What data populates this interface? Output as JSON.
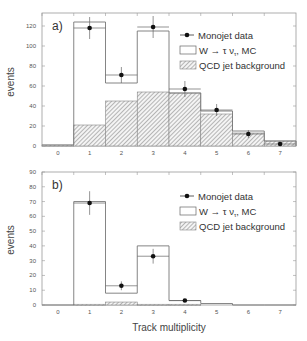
{
  "chart_data": [
    {
      "type": "bar",
      "panel_label": "a)",
      "title": "",
      "xlabel": "",
      "ylabel": "events",
      "categories": [
        "0",
        "1",
        "2",
        "3",
        "4",
        "5",
        "6",
        "7"
      ],
      "xlim": [
        -0.5,
        7.5
      ],
      "ylim": [
        0,
        130
      ],
      "yticks": [
        0,
        20,
        40,
        60,
        80,
        100,
        120
      ],
      "series": [
        {
          "name": "Monojet data",
          "kind": "points",
          "values": [
            null,
            118,
            71,
            119,
            57,
            36,
            12,
            2
          ],
          "errors": [
            null,
            11,
            8,
            11,
            8,
            6,
            4,
            2
          ]
        },
        {
          "name": "W → τ ν_τ MC",
          "kind": "histogram",
          "values": [
            1,
            124,
            63,
            115,
            53,
            35,
            15,
            5
          ]
        },
        {
          "name": "QCD jet background",
          "kind": "hatched-histogram",
          "values": [
            1,
            21,
            45,
            54,
            53,
            32,
            13,
            5
          ]
        }
      ],
      "legend_position": "upper right"
    },
    {
      "type": "bar",
      "panel_label": "b)",
      "title": "",
      "xlabel": "Track multiplicity",
      "ylabel": "events",
      "categories": [
        "0",
        "1",
        "2",
        "3",
        "4",
        "5",
        "6",
        "7"
      ],
      "xlim": [
        -0.5,
        7.5
      ],
      "ylim": [
        0,
        90
      ],
      "yticks": [
        0,
        10,
        20,
        30,
        40,
        50,
        60,
        70,
        80,
        90
      ],
      "series": [
        {
          "name": "Monojet data",
          "kind": "points",
          "values": [
            null,
            69,
            13,
            33,
            3,
            null,
            null,
            null
          ],
          "errors": [
            null,
            8,
            3,
            5,
            1,
            null,
            null,
            null
          ]
        },
        {
          "name": "W → τ ν_τ MC",
          "kind": "histogram",
          "values": [
            0,
            70,
            8,
            40,
            3,
            1,
            0,
            0
          ]
        },
        {
          "name": "QCD jet background",
          "kind": "hatched-histogram",
          "values": [
            0,
            0.5,
            2,
            0.5,
            0.5,
            0,
            0,
            0
          ]
        }
      ],
      "legend_position": "upper right"
    }
  ],
  "legend": {
    "data": "Monojet data",
    "mc_prefix": "W",
    "mc_suffix": "τ ν",
    "mc_sub": "τ",
    "mc_tail": ", MC",
    "qcd": "QCD jet background"
  }
}
